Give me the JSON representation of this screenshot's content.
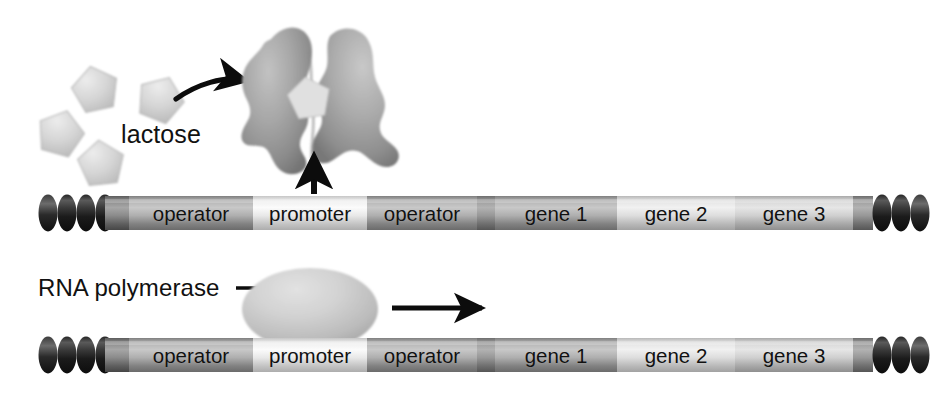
{
  "figure": {
    "panels": [
      {
        "id": "panel-top",
        "caption": "Lactose binds repressor; repressor released from operator"
      },
      {
        "id": "panel-bottom",
        "caption": "RNA polymerase binds promoter and transcribes genes"
      }
    ]
  },
  "labels": {
    "lactose": "lactose",
    "rna_polymerase": "RNA polymerase"
  },
  "dna": {
    "segments": [
      {
        "name": "operator-1",
        "label": "operator"
      },
      {
        "name": "promoter",
        "label": "promoter"
      },
      {
        "name": "operator-2",
        "label": "operator"
      },
      {
        "name": "gene-1",
        "label": "gene 1"
      },
      {
        "name": "gene-2",
        "label": "gene 2"
      },
      {
        "name": "gene-3",
        "label": "gene 3"
      }
    ],
    "coil_rings_left": 4,
    "coil_rings_right": 3
  },
  "molecules": {
    "lactose_free_count": 4,
    "lactose_bound_count": 1,
    "repressor_name": "repressor protein",
    "rna_polymerase_shape": "ellipse"
  },
  "arrows": [
    {
      "name": "lactose-binding-arrow",
      "style": "curved",
      "direction": "right"
    },
    {
      "name": "repressor-release-arrow",
      "style": "straight",
      "direction": "up"
    },
    {
      "name": "transcription-direction-arrow",
      "style": "straight",
      "direction": "right"
    },
    {
      "name": "rna-polymerase-leader-line",
      "style": "leader",
      "direction": "right"
    }
  ],
  "colors": {
    "ink": "#111111",
    "background": "#ffffff",
    "dna_dark": "#6e6e6e",
    "dna_mid": "#9a9a9a",
    "dna_light": "#dcdcdc",
    "dna_lightest": "#ececec",
    "coil_dark": "#1d1d1d",
    "protein_gray": "#9d9d9d",
    "sugar_gray": "#cfcfcf"
  }
}
